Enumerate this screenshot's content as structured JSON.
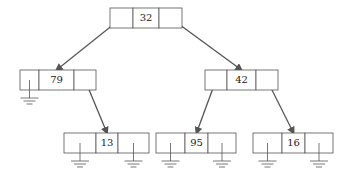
{
  "diagram": {
    "type": "binary-search-tree-linked-representation",
    "nodes": [
      {
        "id": "root",
        "key": "32",
        "x": 110,
        "y": 8,
        "w": [
          23,
          26,
          23
        ],
        "left": "n79",
        "right": "n42"
      },
      {
        "id": "n79",
        "key": "79",
        "x": 20,
        "y": 70,
        "w": [
          19,
          35,
          22
        ],
        "left": null,
        "right": "n13"
      },
      {
        "id": "n42",
        "key": "42",
        "x": 205,
        "y": 70,
        "w": [
          22,
          29,
          22
        ],
        "left": "n95",
        "right": "n16"
      },
      {
        "id": "n13",
        "key": "13",
        "x": 64,
        "y": 133,
        "w": [
          32,
          22,
          31
        ],
        "left": null,
        "right": null
      },
      {
        "id": "n95",
        "key": "95",
        "x": 156,
        "y": 133,
        "w": [
          29,
          23,
          28
        ],
        "left": null,
        "right": null
      },
      {
        "id": "n16",
        "key": "16",
        "x": 253,
        "y": 133,
        "w": [
          29,
          23,
          28
        ],
        "left": null,
        "right": null
      }
    ],
    "edges": [
      {
        "from": "root",
        "to": "n79",
        "side": "left"
      },
      {
        "from": "root",
        "to": "n42",
        "side": "right"
      },
      {
        "from": "n79",
        "to": "n13",
        "side": "right"
      },
      {
        "from": "n42",
        "to": "n95",
        "side": "left"
      },
      {
        "from": "n42",
        "to": "n16",
        "side": "right"
      }
    ],
    "null_pointer_symbol": "ground",
    "colors": {
      "line": "#555555",
      "text": "#222222",
      "background": "#ffffff"
    }
  }
}
